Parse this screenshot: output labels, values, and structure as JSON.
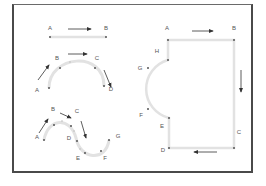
{
  "colors": {
    "frame": "#4a4a4a",
    "path": "#e2e2e2",
    "point": "#555555",
    "arrow": "#333333",
    "label": "#555555"
  },
  "diagrams": {
    "straight_line": {
      "labels": {
        "A": "A",
        "B": "B"
      }
    },
    "arc": {
      "labels": {
        "A": "A",
        "B": "B",
        "C": "C",
        "D": "D"
      }
    },
    "s_curve": {
      "labels": {
        "A": "A",
        "B": "B",
        "C": "C",
        "D": "D",
        "E": "E",
        "F": "F",
        "G": "G"
      }
    },
    "closed_shape": {
      "labels": {
        "A": "A",
        "B": "B",
        "C": "C",
        "D": "D",
        "E": "E",
        "F": "F",
        "G": "G",
        "H": "H"
      }
    }
  }
}
